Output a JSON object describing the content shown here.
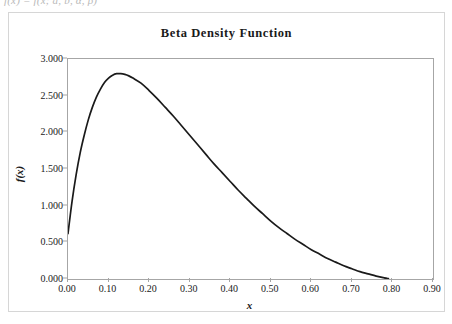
{
  "page": {
    "cutoff_formula_text": "f(x) = f(x; a, b, α, β)"
  },
  "chart": {
    "title": "Beta Density Function",
    "xaxis_title": "x",
    "yaxis_title": "f(x)",
    "border_color": "#a6a6a6",
    "frame_color": "#d6d6d6",
    "curve_color": "#1a1a1a",
    "background": "#ffffff"
  },
  "chart_data": {
    "type": "line",
    "title": "Beta Density Function",
    "xlabel": "x",
    "ylabel": "f(x)",
    "xlim": [
      0.0,
      0.9
    ],
    "ylim": [
      0.0,
      3.0
    ],
    "grid": false,
    "legend": "none",
    "xticks": [
      "0.00",
      "0.10",
      "0.20",
      "0.30",
      "0.40",
      "0.50",
      "0.60",
      "0.70",
      "0.80",
      "0.90"
    ],
    "yticks": [
      "0.000",
      "0.500",
      "1.000",
      "1.500",
      "2.000",
      "2.500",
      "3.000"
    ],
    "xtick_values": [
      0.0,
      0.1,
      0.2,
      0.3,
      0.4,
      0.5,
      0.6,
      0.7,
      0.8,
      0.9
    ],
    "ytick_values": [
      0.0,
      0.5,
      1.0,
      1.5,
      2.0,
      2.5,
      3.0
    ],
    "series": [
      {
        "name": "Beta density",
        "x": [
          0.0,
          0.01,
          0.02,
          0.03,
          0.04,
          0.05,
          0.06,
          0.07,
          0.08,
          0.09,
          0.1,
          0.11,
          0.12,
          0.13,
          0.14,
          0.15,
          0.16,
          0.18,
          0.2,
          0.22,
          0.24,
          0.26,
          0.28,
          0.3,
          0.32,
          0.34,
          0.36,
          0.38,
          0.4,
          0.42,
          0.44,
          0.46,
          0.48,
          0.5,
          0.52,
          0.54,
          0.56,
          0.58,
          0.6,
          0.62,
          0.64,
          0.66,
          0.68,
          0.7,
          0.72,
          0.74,
          0.76,
          0.78,
          0.79
        ],
        "y": [
          0.62,
          1.06,
          1.42,
          1.72,
          1.96,
          2.17,
          2.34,
          2.48,
          2.59,
          2.68,
          2.74,
          2.78,
          2.8,
          2.8,
          2.79,
          2.77,
          2.74,
          2.67,
          2.57,
          2.46,
          2.34,
          2.22,
          2.09,
          1.96,
          1.83,
          1.7,
          1.57,
          1.45,
          1.33,
          1.21,
          1.1,
          0.99,
          0.89,
          0.79,
          0.7,
          0.62,
          0.54,
          0.47,
          0.4,
          0.34,
          0.28,
          0.23,
          0.18,
          0.14,
          0.1,
          0.07,
          0.04,
          0.015,
          0.005
        ]
      }
    ]
  }
}
